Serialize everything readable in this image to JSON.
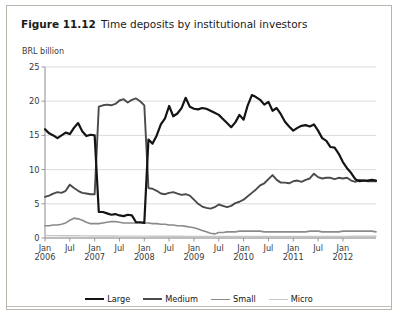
{
  "figure": {
    "number": "Figure 11.12",
    "title": "Time deposits by institutional investors",
    "unit_label": "BRL billion"
  },
  "legend": {
    "position": "bottom-center",
    "items": [
      {
        "label": "Large",
        "color": "#141414"
      },
      {
        "label": "Medium",
        "color": "#4a4a4a"
      },
      {
        "label": "Small",
        "color": "#8a8a8a"
      },
      {
        "label": "Micro",
        "color": "#c6c6c6"
      }
    ]
  },
  "chart_data": {
    "type": "line",
    "title": "Time deposits by institutional investors",
    "xlabel": "",
    "ylabel": "BRL billion",
    "ylim": [
      0,
      25
    ],
    "yticks": [
      0,
      5,
      10,
      15,
      20,
      25
    ],
    "ytick_labels": [
      "0",
      "5",
      "10",
      "15",
      "20",
      "25"
    ],
    "grid": true,
    "grid_axis": "y",
    "xtick_labels": [
      {
        "month": "Jan",
        "year": "2006"
      },
      {
        "month": "Jul",
        "year": ""
      },
      {
        "month": "Jan",
        "year": "2007"
      },
      {
        "month": "Jul",
        "year": ""
      },
      {
        "month": "Jan",
        "year": "2008"
      },
      {
        "month": "Jul",
        "year": ""
      },
      {
        "month": "Jan",
        "year": "2009"
      },
      {
        "month": "Jul",
        "year": ""
      },
      {
        "month": "Jan",
        "year": "2010"
      },
      {
        "month": "Jul",
        "year": ""
      },
      {
        "month": "Jan",
        "year": "2011"
      },
      {
        "month": "Jul",
        "year": ""
      },
      {
        "month": "Jan",
        "year": "2012"
      }
    ],
    "x_start": "2006-01",
    "x_end": "2012-09",
    "x_count": 81,
    "note": "Between Jan 2007 and Dec 2007 the Large and Medium series exchange levels (reclassification break).",
    "series": [
      {
        "name": "Large",
        "color": "#141414",
        "values": [
          15.9,
          15.3,
          15.0,
          14.6,
          15.0,
          15.4,
          15.2,
          16.1,
          16.8,
          15.6,
          14.9,
          15.1,
          15.0,
          3.8,
          3.8,
          3.6,
          3.4,
          3.5,
          3.3,
          3.2,
          3.4,
          3.3,
          2.3,
          2.3,
          2.2,
          14.4,
          13.8,
          15.0,
          16.6,
          17.5,
          19.3,
          17.8,
          18.2,
          19.0,
          20.5,
          19.2,
          18.9,
          18.8,
          19.0,
          18.9,
          18.6,
          18.3,
          18.0,
          17.4,
          16.8,
          16.2,
          16.9,
          18.0,
          17.3,
          19.4,
          20.9,
          20.6,
          20.2,
          19.5,
          19.9,
          18.6,
          19.0,
          18.1,
          17.0,
          16.3,
          15.7,
          16.1,
          16.4,
          16.5,
          16.3,
          16.6,
          15.7,
          14.6,
          14.2,
          13.3,
          13.2,
          12.3,
          11.1,
          10.2,
          9.5,
          8.6,
          8.3,
          8.4,
          8.4,
          8.5,
          8.4
        ]
      },
      {
        "name": "Medium",
        "color": "#4a4a4a",
        "values": [
          6.0,
          6.2,
          6.5,
          6.7,
          6.6,
          6.9,
          7.8,
          7.3,
          6.9,
          6.6,
          6.5,
          6.4,
          6.4,
          19.2,
          19.4,
          19.5,
          19.4,
          19.6,
          20.1,
          20.3,
          19.8,
          20.2,
          20.4,
          20.0,
          19.4,
          7.3,
          7.2,
          6.9,
          6.5,
          6.4,
          6.6,
          6.7,
          6.5,
          6.3,
          6.4,
          6.2,
          5.6,
          5.0,
          4.6,
          4.4,
          4.3,
          4.5,
          4.9,
          4.7,
          4.5,
          4.7,
          5.1,
          5.3,
          5.6,
          6.1,
          6.6,
          7.1,
          7.7,
          8.0,
          8.6,
          9.2,
          8.5,
          8.1,
          8.1,
          8.0,
          8.3,
          8.4,
          8.2,
          8.5,
          8.7,
          9.4,
          8.9,
          8.7,
          8.8,
          8.8,
          8.6,
          8.8,
          8.7,
          8.8,
          8.4,
          8.2,
          8.5,
          8.4,
          8.3,
          8.3,
          8.3
        ]
      },
      {
        "name": "Small",
        "color": "#8a8a8a",
        "values": [
          1.8,
          1.8,
          1.9,
          1.9,
          2.0,
          2.2,
          2.6,
          2.9,
          2.8,
          2.6,
          2.3,
          2.1,
          2.1,
          2.1,
          2.2,
          2.3,
          2.4,
          2.4,
          2.3,
          2.2,
          2.2,
          2.2,
          2.2,
          2.2,
          2.2,
          2.2,
          2.1,
          2.1,
          2.0,
          2.0,
          1.9,
          1.9,
          1.8,
          1.8,
          1.7,
          1.6,
          1.5,
          1.3,
          1.1,
          0.9,
          0.7,
          0.6,
          0.8,
          0.8,
          0.9,
          0.9,
          0.9,
          1.0,
          1.0,
          1.0,
          1.0,
          1.0,
          1.0,
          0.9,
          0.9,
          0.9,
          0.9,
          0.9,
          0.9,
          0.9,
          0.9,
          0.9,
          0.9,
          0.9,
          1.0,
          1.0,
          1.0,
          0.9,
          0.9,
          0.9,
          0.9,
          0.9,
          1.0,
          1.0,
          1.0,
          1.0,
          1.0,
          1.0,
          1.0,
          1.0,
          0.9
        ]
      },
      {
        "name": "Micro",
        "color": "#c6c6c6",
        "values": [
          0.35,
          0.35,
          0.34,
          0.34,
          0.33,
          0.33,
          0.33,
          0.32,
          0.32,
          0.31,
          0.31,
          0.3,
          0.3,
          0.3,
          0.3,
          0.29,
          0.29,
          0.29,
          0.28,
          0.28,
          0.28,
          0.28,
          0.27,
          0.27,
          0.27,
          0.27,
          0.26,
          0.26,
          0.26,
          0.26,
          0.25,
          0.25,
          0.25,
          0.25,
          0.24,
          0.24,
          0.24,
          0.24,
          0.23,
          0.23,
          0.23,
          0.22,
          0.22,
          0.22,
          0.22,
          0.22,
          0.22,
          0.22,
          0.22,
          0.22,
          0.22,
          0.22,
          0.22,
          0.22,
          0.22,
          0.22,
          0.22,
          0.22,
          0.22,
          0.22,
          0.22,
          0.22,
          0.22,
          0.22,
          0.23,
          0.23,
          0.23,
          0.23,
          0.23,
          0.23,
          0.24,
          0.24,
          0.24,
          0.24,
          0.25,
          0.25,
          0.25,
          0.25,
          0.26,
          0.26,
          0.26
        ]
      }
    ]
  },
  "style": {
    "axis_color": "#8d8d8d",
    "grid_color": "#d2d2d2",
    "tick_label_color": "#3a3a3a",
    "frame_color": "#b9b5ad"
  }
}
